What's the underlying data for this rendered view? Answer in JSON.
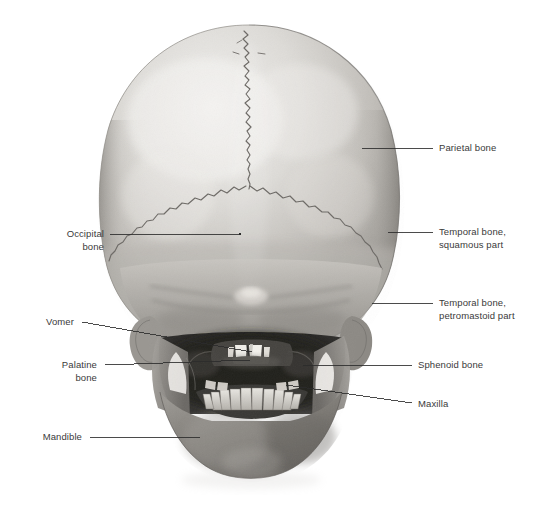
{
  "figure": {
    "background_color": "#ffffff",
    "label_color": "#3a3a3a",
    "leader_color": "#2b2b2b",
    "width": 543,
    "height": 529
  },
  "labels": {
    "parietal_bone": "Parietal bone",
    "temporal_squamous": "Temporal bone,\nsquamous part",
    "temporal_petromastoid": "Temporal bone,\npetromastoid part",
    "sphenoid_bone": "Sphenoid bone",
    "maxilla": "Maxilla",
    "occipital_bone": "Occipital\nbone",
    "vomer": "Vomer",
    "palatine_bone": "Palatine\nbone",
    "mandible": "Mandible"
  },
  "structures": [
    {
      "name": "parietal-bone",
      "label": "Parietal bone",
      "side": "right"
    },
    {
      "name": "temporal-bone-squamous-part",
      "label": "Temporal bone, squamous part",
      "side": "right"
    },
    {
      "name": "temporal-bone-petromastoid-part",
      "label": "Temporal bone, petromastoid part",
      "side": "right"
    },
    {
      "name": "sphenoid-bone",
      "label": "Sphenoid bone",
      "side": "right"
    },
    {
      "name": "maxilla",
      "label": "Maxilla",
      "side": "right"
    },
    {
      "name": "occipital-bone",
      "label": "Occipital bone",
      "side": "left"
    },
    {
      "name": "vomer",
      "label": "Vomer",
      "side": "left"
    },
    {
      "name": "palatine-bone",
      "label": "Palatine bone",
      "side": "left"
    },
    {
      "name": "mandible",
      "label": "Mandible",
      "side": "left"
    }
  ]
}
